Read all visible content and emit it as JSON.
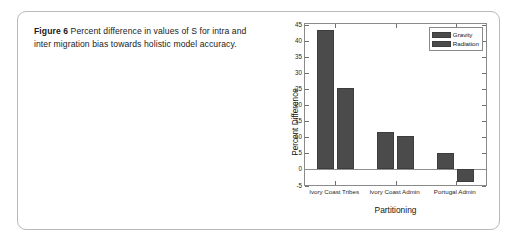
{
  "figure": {
    "caption_lead": "Figure 6",
    "caption_text": "Percent difference in values of S for intra and inter migration bias towards holistic model accuracy."
  },
  "chart_data": {
    "type": "bar",
    "title": "",
    "xlabel": "Partitioning",
    "ylabel": "Percent Difference",
    "categories": [
      "Ivory Coast Tribes",
      "Ivory Coast Admin",
      "Portugal Admin"
    ],
    "series": [
      {
        "name": "Gravity",
        "values": [
          43.2,
          11.4,
          4.8
        ]
      },
      {
        "name": "Radiation",
        "values": [
          25.2,
          10.2,
          -4.0
        ]
      }
    ],
    "ylim": [
      -5,
      45
    ],
    "yticks": [
      -5,
      0,
      5,
      10,
      15,
      20,
      25,
      30,
      35,
      40,
      45
    ],
    "ytick_labels": [
      "-5",
      "0",
      "5",
      "10",
      "15",
      "20",
      "25",
      "30",
      "35",
      "40",
      "45"
    ],
    "grid": false,
    "legend_position": "top-right",
    "bar_color": "#4b4b4b",
    "axis_color": "#8a8a8a",
    "zero_line": 0
  }
}
